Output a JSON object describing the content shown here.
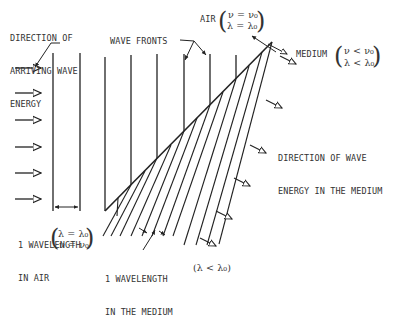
{
  "labels": {
    "arriving": [
      "DIRECTION OF",
      "ARRIVING WAVE",
      "ENERGY"
    ],
    "wave_fronts": "WAVE FRONTS",
    "air": "AIR",
    "air_eq1": "ν = ν₀",
    "air_eq2": "λ = λ₀",
    "medium": "MEDIUM",
    "medium_eq1": "ν < ν₀",
    "medium_eq2": "λ < λ₀",
    "direction_medium": [
      "DIRECTION OF WAVE",
      "ENERGY IN THE MEDIUM"
    ],
    "wl_air": [
      "1 WAVELENGTH",
      "IN AIR"
    ],
    "wl_air_eq1": "λ = λ₀",
    "wl_air_eq2": "ν = ν₀",
    "wl_medium": [
      "1 WAVELENGTH",
      "IN THE MEDIUM"
    ],
    "wl_medium_eq": "(λ < λ₀)"
  },
  "colors": {
    "ink": "#222222",
    "background": "#ffffff"
  }
}
